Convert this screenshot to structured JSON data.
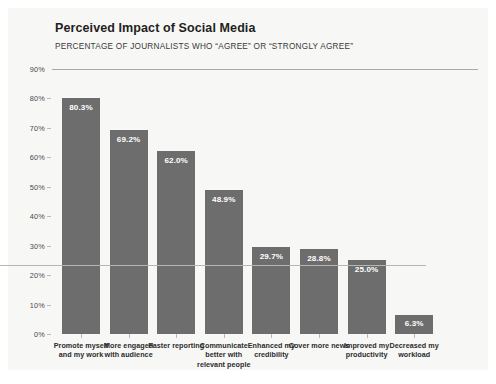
{
  "chart_data": {
    "type": "bar",
    "title": "Perceived Impact of Social Media",
    "subtitle": "PERCENTAGE OF JOURNALISTS WHO “AGREE” OR “STRONGLY AGREE”",
    "xlabel": "",
    "ylabel": "",
    "ylim": [
      0,
      90
    ],
    "ytick_labels": [
      "90%",
      "80%",
      "70%",
      "60%",
      "50%",
      "40%",
      "30%",
      "20%",
      "10%",
      "0%"
    ],
    "ytick_values": [
      90,
      80,
      70,
      60,
      50,
      40,
      30,
      20,
      10,
      0
    ],
    "grid": "top-line-only",
    "legend": "none",
    "bar_color": "#6d6d6d",
    "value_label_color": "#ffffff",
    "categories": [
      "Promote myself and my work",
      "More engaged with audience",
      "Faster reporting",
      "Communicate better with relevant people",
      "Enhanced my credibility",
      "Cover more news",
      "Improved my productivity",
      "Decreased my workload"
    ],
    "category_lines": [
      [
        "Promote myself",
        "and my work"
      ],
      [
        "More engaged",
        "with audience"
      ],
      [
        "Faster reporting"
      ],
      [
        "Communicate",
        "better with",
        "relevant people"
      ],
      [
        "Enhanced my",
        "credibility"
      ],
      [
        "Cover more news"
      ],
      [
        "Improved my",
        "productivity"
      ],
      [
        "Decreased my",
        "workload"
      ]
    ],
    "values": [
      80.3,
      69.2,
      62.0,
      48.9,
      29.7,
      28.8,
      25.0,
      6.3
    ],
    "value_labels": [
      "80.3%",
      "69.2%",
      "62.0%",
      "48.9%",
      "29.7%",
      "28.8%",
      "25.0%",
      "6.3%"
    ]
  }
}
